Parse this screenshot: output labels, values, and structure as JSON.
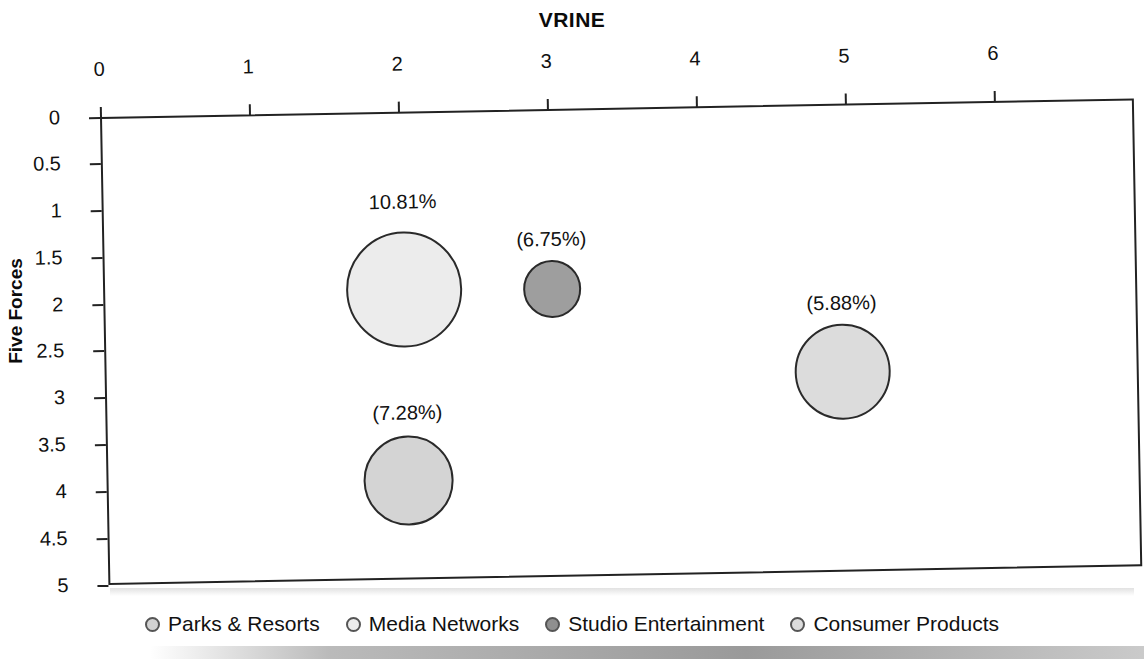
{
  "chart_data": {
    "type": "scatter",
    "title": "VRINE",
    "xlabel": "VRINE",
    "ylabel": "Five Forces",
    "xlim": [
      0,
      7
    ],
    "ylim": [
      0,
      5
    ],
    "y_inverted": true,
    "grid": false,
    "legend_position": "bottom",
    "x_ticks": [
      "0",
      "1",
      "2",
      "3",
      "4",
      "5",
      "6"
    ],
    "y_ticks": [
      "0",
      "0.5",
      "1",
      "1.5",
      "2",
      "2.5",
      "3",
      "3.5",
      "4",
      "4.5",
      "5"
    ],
    "series": [
      {
        "name": "Parks & Resorts",
        "label": "(7.28%)",
        "x": 2,
        "y": 3.95,
        "size": 7.28,
        "color": "#d4d4d4"
      },
      {
        "name": "Media Networks",
        "label": "10.81%",
        "x": 2,
        "y": 1.95,
        "size": 10.81,
        "color": "#ececec"
      },
      {
        "name": "Studio Entertainment",
        "label": "(6.75%)",
        "x": 3,
        "y": 1.98,
        "size": 6.75,
        "color": "#9e9e9e"
      },
      {
        "name": "Consumer Products",
        "label": "(5.88%)",
        "x": 5,
        "y": 2.9,
        "size": 5.88,
        "color": "#dcdcdc"
      }
    ]
  },
  "legend": {
    "items": [
      {
        "label": "Parks & Resorts",
        "color": "#d2d2d2"
      },
      {
        "label": "Media Networks",
        "color": "#ededed"
      },
      {
        "label": "Studio Entertainment",
        "color": "#8f8f8f"
      },
      {
        "label": "Consumer Products",
        "color": "#dcdcdc"
      }
    ]
  },
  "axes": {
    "x_title": "VRINE",
    "y_title": "Five Forces",
    "x_ticks": [
      {
        "value": "0",
        "px": 100
      },
      {
        "value": "1",
        "px": 249
      },
      {
        "value": "2",
        "px": 398
      },
      {
        "value": "3",
        "px": 547
      },
      {
        "value": "4",
        "px": 696
      },
      {
        "value": "5",
        "px": 845
      },
      {
        "value": "6",
        "px": 994
      }
    ],
    "y_ticks": [
      {
        "value": "0",
        "px": 117
      },
      {
        "value": "0.5",
        "px": 163
      },
      {
        "value": "1",
        "px": 210
      },
      {
        "value": "1.5",
        "px": 257
      },
      {
        "value": "2",
        "px": 304
      },
      {
        "value": "2.5",
        "px": 350
      },
      {
        "value": "3",
        "px": 397
      },
      {
        "value": "3.5",
        "px": 444
      },
      {
        "value": "4",
        "px": 491
      },
      {
        "value": "4.5",
        "px": 538
      },
      {
        "value": "5",
        "px": 585
      }
    ]
  },
  "bubbles": [
    {
      "name": "media-networks",
      "label": "10.81%",
      "cx": 401,
      "cy": 295,
      "r": 58,
      "color": "#ececec",
      "label_y": 196
    },
    {
      "name": "studio-entertainment",
      "label": "(6.75%)",
      "cx": 549,
      "cy": 297,
      "r": 29,
      "color": "#9e9e9e",
      "label_y": 236
    },
    {
      "name": "parks-and-resorts",
      "label": "(7.28%)",
      "cx": 402,
      "cy": 486,
      "r": 45,
      "color": "#d4d4d4",
      "label_y": 407
    },
    {
      "name": "consumer-products",
      "label": "(5.88%)",
      "cx": 838,
      "cy": 385,
      "r": 48,
      "color": "#dcdcdc",
      "label_y": 305
    }
  ]
}
